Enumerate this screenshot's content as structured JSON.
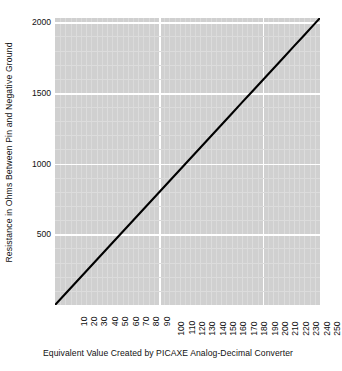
{
  "chart_data": {
    "type": "line",
    "title": "",
    "xlabel": "Equivalent Value Created by PICAXE Analog-Decimal Converter",
    "ylabel": "Resistance in Ohms Between Pin and Negative Ground",
    "xlim": [
      0,
      255
    ],
    "ylim": [
      0,
      2030
    ],
    "grid": true,
    "legend": "none",
    "x_major_ticks": [
      100,
      200
    ],
    "y_major_ticks": [
      500,
      1000,
      1500,
      2000
    ],
    "x_tick_labels": [
      "10",
      "20",
      "30",
      "40",
      "50",
      "60",
      "70",
      "80",
      "90",
      "100",
      "110",
      "120",
      "130",
      "140",
      "150",
      "160",
      "170",
      "180",
      "190",
      "200",
      "210",
      "220",
      "230",
      "240",
      "250"
    ],
    "x_tick_values": [
      10,
      20,
      30,
      40,
      50,
      60,
      70,
      80,
      90,
      100,
      110,
      120,
      130,
      140,
      150,
      160,
      170,
      180,
      190,
      200,
      210,
      220,
      230,
      240,
      250
    ],
    "y_tick_labels": [
      "500",
      "1000",
      "1500",
      "2000"
    ],
    "y_tick_values": [
      500,
      1000,
      1500,
      2000
    ],
    "series": [
      {
        "name": "resistance",
        "color": "#000000",
        "x": [
          0,
          10,
          20,
          30,
          40,
          50,
          60,
          70,
          80,
          90,
          100,
          110,
          120,
          130,
          140,
          150,
          160,
          170,
          180,
          190,
          200,
          210,
          220,
          230,
          240,
          250,
          255
        ],
        "values": [
          0,
          80,
          159,
          239,
          318,
          398,
          477,
          557,
          637,
          716,
          796,
          875,
          955,
          1035,
          1114,
          1194,
          1273,
          1353,
          1433,
          1512,
          1592,
          1671,
          1751,
          1831,
          1910,
          1990,
          2030
        ]
      }
    ],
    "panel_background": "#d0d0d0",
    "major_gridline_color": "#ffffff",
    "minor_gridline_color": "#dcdcdc",
    "page_background": "#ffffff"
  }
}
